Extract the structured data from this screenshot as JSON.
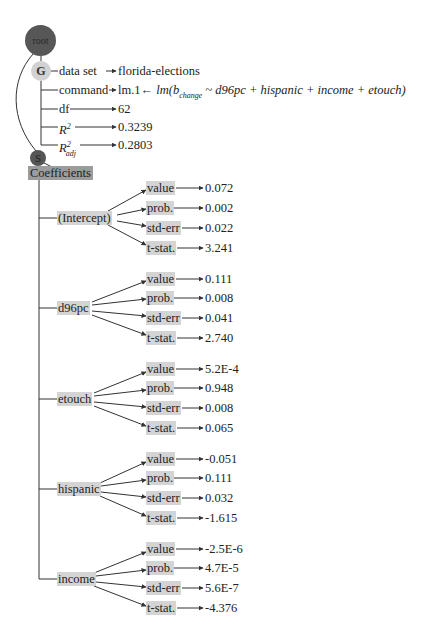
{
  "root": {
    "label": "root",
    "color": "#575757"
  },
  "general": {
    "label": "G",
    "color": "#d2d2d2",
    "rows": [
      {
        "key": "data set",
        "value": "florida-elections"
      },
      {
        "key": "command",
        "value": "lm.1← lm(b_change ~ d96pc + hispanic + income + etouch)"
      },
      {
        "key": "df",
        "value": "62"
      },
      {
        "key": "R^2",
        "value": "0.3239"
      },
      {
        "key": "R^2_adj",
        "value": "0.2803"
      }
    ],
    "command_prefix": "lm.1←",
    "command_formula_fn": "lm(",
    "command_formula_b": "b",
    "command_formula_sub": "change",
    "command_formula_rest": " ~ d96pc + hispanic + income + etouch)"
  },
  "summary": {
    "label": "S",
    "color": "#555555",
    "section": "Coefficients",
    "coefficients": [
      {
        "name": "(Intercept)",
        "value": "0.072",
        "prob": "0.002",
        "std_err": "0.022",
        "t_stat": "3.241"
      },
      {
        "name": "d96pc",
        "value": "0.111",
        "prob": "0.008",
        "std_err": "0.041",
        "t_stat": "2.740"
      },
      {
        "name": "etouch",
        "value": "5.2E-4",
        "prob": "0.948",
        "std_err": "0.008",
        "t_stat": "0.065"
      },
      {
        "name": "hispanic",
        "value": "-0.051",
        "prob": "0.111",
        "std_err": "0.032",
        "t_stat": "-1.615"
      },
      {
        "name": "income",
        "value": "-2.5E-6",
        "prob": "4.7E-5",
        "std_err": "5.6E-7",
        "t_stat": "-4.376"
      }
    ],
    "field_labels": {
      "value": "value",
      "prob": "prob.",
      "std_err": "std-err",
      "t_stat": "t-stat."
    }
  }
}
